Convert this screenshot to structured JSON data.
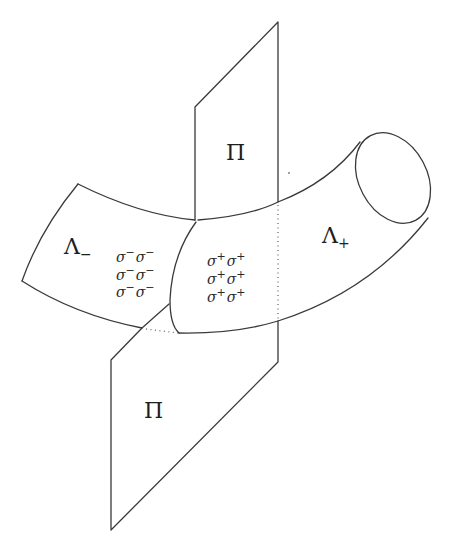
{
  "figure": {
    "plane_label_upper": "Π",
    "plane_label_lower": "Π",
    "lambda_minus": {
      "base": "Λ",
      "sub": "−"
    },
    "lambda_plus": {
      "base": "Λ",
      "sub": "+"
    },
    "sigma_minus_grid": {
      "symbol": "σ",
      "sup": "−",
      "rows": 3,
      "cols": 2
    },
    "sigma_plus_grid": {
      "symbol": "σ",
      "sup": "+",
      "rows": 3,
      "cols": 2
    }
  }
}
